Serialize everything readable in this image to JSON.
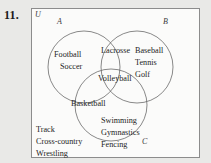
{
  "problem": {
    "number": "11."
  },
  "diagram": {
    "type": "venn-3-set",
    "universe_label": "U",
    "set_labels": {
      "a": "A",
      "b": "B",
      "c": "C"
    },
    "regions": {
      "a_only": [
        "Football",
        "Soccer"
      ],
      "b_only": [
        "Baseball",
        "Tennis",
        "Golf"
      ],
      "c_only": [
        "Swimming",
        "Gymnastics",
        "Fencing"
      ],
      "a_and_b": [
        "Lacrosse"
      ],
      "a_and_c": [
        "Basketball"
      ],
      "b_and_c": [],
      "a_and_b_and_c": [
        "Volleyball"
      ],
      "outside": [
        "Track",
        "Cross-country",
        "Wrestling"
      ]
    }
  },
  "colors": {
    "page_background": "#e9e9e7",
    "box_background": "#fbfbfa",
    "border": "#8c8c8c",
    "circle_stroke": "#6b6b6b",
    "text": "#242424"
  }
}
